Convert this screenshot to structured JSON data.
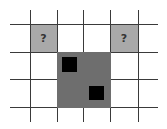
{
  "diagram": {
    "grid": {
      "vertical_x": [
        30,
        57,
        83,
        110,
        138
      ],
      "horizontal_y": [
        24,
        52,
        79,
        107
      ],
      "line_color": "#3a3a3a"
    },
    "unknown_cells": [
      {
        "label": "?",
        "x": 30,
        "y": 24,
        "w": 27,
        "h": 28,
        "color": "#a9a9a9"
      },
      {
        "label": "?",
        "x": 110,
        "y": 24,
        "w": 28,
        "h": 28,
        "color": "#a9a9a9"
      }
    ],
    "dark_region": {
      "x": 57,
      "y": 52,
      "w": 53,
      "h": 55,
      "color": "#6e6e6e"
    },
    "black_squares": [
      {
        "x": 62,
        "y": 57,
        "w": 15,
        "h": 15
      },
      {
        "x": 89,
        "y": 86,
        "w": 15,
        "h": 14
      }
    ]
  }
}
